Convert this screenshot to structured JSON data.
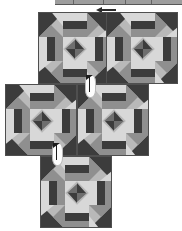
{
  "diagram": {
    "background_color": "#ffffff",
    "canvas": {
      "width": 182,
      "height": 231
    }
  },
  "palette": {
    "dark": "#3c3c3c",
    "mid_dark": "#6e6e6e",
    "mid": "#8f8f8f",
    "light": "#b9b9b9",
    "very_light": "#d8d8d8",
    "white": "#ededed",
    "outline": "#4f4f4f",
    "pin_body": "#fdfdfd",
    "pin_metal": "#1c1c1c"
  },
  "top_edge": {
    "label": "cropped-strip-above",
    "color": "#8c8c8c",
    "segment_positions": [
      18,
      48,
      70,
      96
    ]
  },
  "arrow": {
    "label": "direction-arrow",
    "points": "left",
    "color": "#2b2b2b"
  },
  "blocks": [
    {
      "id": "block-top-left",
      "label": "Block 1",
      "x": 38,
      "y": 12,
      "rotation": 0
    },
    {
      "id": "block-top-right",
      "label": "Block 2",
      "x": 106,
      "y": 12,
      "rotation": 0
    },
    {
      "id": "block-middle-left",
      "label": "Block 3",
      "x": 5,
      "y": 84,
      "rotation": 0
    },
    {
      "id": "block-middle-right",
      "label": "Block 4",
      "x": 77,
      "y": 84,
      "rotation": 0
    },
    {
      "id": "block-bottom",
      "label": "Block 5",
      "x": 40,
      "y": 156,
      "rotation": 0
    }
  ],
  "pins": [
    {
      "id": "pin-upper",
      "label": "Pin at top seam intersection",
      "x": 85,
      "y": 74
    },
    {
      "id": "pin-lower",
      "label": "Pin at bottom seam intersection",
      "x": 52,
      "y": 142
    }
  ],
  "block_structure": {
    "grid": "3x3",
    "cells": [
      "corner-flying-geese-tl",
      "edge-rail-top",
      "corner-flying-geese-tr",
      "edge-rail-left",
      "center-pinwheel",
      "edge-rail-right",
      "corner-flying-geese-bl",
      "edge-rail-bottom",
      "corner-flying-geese-br"
    ]
  }
}
